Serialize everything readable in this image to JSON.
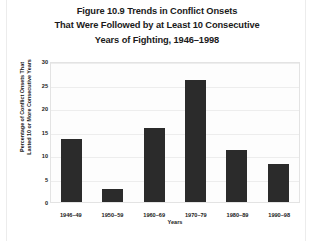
{
  "figure": {
    "title_lines": [
      "Figure 10.9 Trends in Conflict Onsets",
      "That Were Followed by at Least 10 Consecutive",
      "Years of Fighting, 1946–1998"
    ]
  },
  "axes": {
    "y_title_lines": [
      "Percentage of Conflict Onsets That",
      "Lasted 10 or More Consecutive Years"
    ],
    "x_title": "Years",
    "y_ticks": [
      "0",
      "5",
      "10",
      "15",
      "20",
      "25",
      "30"
    ]
  },
  "colors": {
    "bar": "#2b2b2b",
    "gridline": "#ededed",
    "plot_background": "#fdfdfd",
    "plot_border": "#e3e3e3",
    "text": "#1a1a1a"
  },
  "chart_data": {
    "type": "bar",
    "title": "Figure 10.9 Trends in Conflict Onsets That Were Followed by at Least 10 Consecutive Years of Fighting, 1946–1998",
    "xlabel": "Years",
    "ylabel": "Percentage of Conflict Onsets That Lasted 10 or More Consecutive Years",
    "categories": [
      "1946–49",
      "1950–59",
      "1960–69",
      "1970–79",
      "1980–89",
      "1990–98"
    ],
    "values": [
      13.5,
      2.8,
      15.7,
      26.0,
      11.1,
      8.1
    ],
    "ylim": [
      0,
      30
    ],
    "ytick_step": 5,
    "grid": true,
    "legend": null
  }
}
